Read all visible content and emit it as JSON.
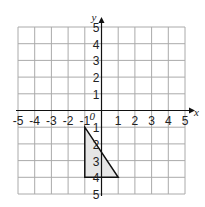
{
  "chart_data": {
    "type": "scatter",
    "title": "",
    "xlabel": "x",
    "ylabel": "y",
    "xlim": [
      -5,
      5
    ],
    "ylim": [
      -5,
      5
    ],
    "grid": true,
    "origin_label": "0",
    "x_ticks": [
      "-5",
      "-4",
      "-3",
      "-2",
      "-1",
      "1",
      "2",
      "3",
      "4",
      "5"
    ],
    "y_ticks": [
      "5",
      "4",
      "3",
      "2",
      "1",
      "-1",
      "-2",
      "-3",
      "-4",
      "-5"
    ],
    "y_tick_display": [
      "5",
      "4",
      "3",
      "2",
      "1",
      "1",
      "2",
      "3",
      "4",
      "5"
    ],
    "shapes": [
      {
        "type": "triangle",
        "vertices": [
          [
            -1,
            -1
          ],
          [
            -1,
            -4
          ],
          [
            1,
            -4
          ]
        ],
        "fill": "#e6e6e6",
        "stroke": "#111111"
      }
    ]
  }
}
